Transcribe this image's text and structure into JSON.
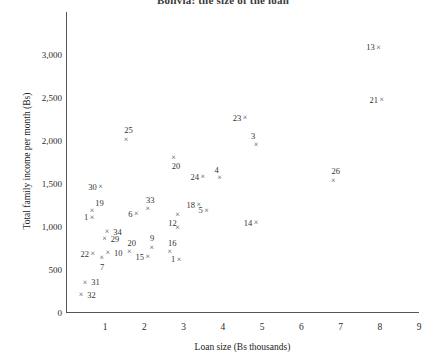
{
  "chart_data": {
    "type": "scatter",
    "title": "Bolivia: the size of the loan",
    "xlabel": "Loan size (Bs thousands)",
    "ylabel": "Total family income per month (Bs)",
    "xlim": [
      0.35,
      9.3
    ],
    "ylim": [
      0,
      3250
    ],
    "xticks": [
      "1",
      "2",
      "3",
      "4",
      "5",
      "6",
      "7",
      "8",
      "9"
    ],
    "yticks": [
      "0",
      "500",
      "1,000",
      "1,500",
      "2,000",
      "2,500",
      "3,000"
    ],
    "grid": false,
    "legend": null,
    "marker": "x",
    "marker_color": "#3f3f3f",
    "points": [
      {
        "label": "13",
        "x": 8.0,
        "y": 3080,
        "label_pos": "left"
      },
      {
        "label": "21",
        "x": 8.08,
        "y": 2470,
        "label_pos": "left"
      },
      {
        "label": "23",
        "x": 4.6,
        "y": 2260,
        "label_pos": "left"
      },
      {
        "label": "3",
        "x": 4.88,
        "y": 1950,
        "label_pos": "aboveleft"
      },
      {
        "label": "25",
        "x": 1.57,
        "y": 2010,
        "label_pos": "above"
      },
      {
        "label": "20",
        "x": 2.78,
        "y": 1800,
        "label_pos": "below"
      },
      {
        "label": "26",
        "x": 6.85,
        "y": 1530,
        "label_pos": "above"
      },
      {
        "label": "24",
        "x": 3.52,
        "y": 1575,
        "label_pos": "left"
      },
      {
        "label": "4",
        "x": 3.95,
        "y": 1560,
        "label_pos": "aboveleft"
      },
      {
        "label": "30",
        "x": 0.92,
        "y": 1455,
        "label_pos": "left"
      },
      {
        "label": "18",
        "x": 3.42,
        "y": 1250,
        "label_pos": "left"
      },
      {
        "label": "5",
        "x": 3.62,
        "y": 1185,
        "label_pos": "left"
      },
      {
        "label": "33",
        "x": 2.12,
        "y": 1200,
        "label_pos": "above"
      },
      {
        "label": "6",
        "x": 1.83,
        "y": 1140,
        "label_pos": "left"
      },
      {
        "label": "19",
        "x": 0.7,
        "y": 1175,
        "label_pos": "aboveright"
      },
      {
        "label": "1",
        "x": 0.7,
        "y": 1100,
        "label_pos": "left"
      },
      {
        "label": "12",
        "x": 2.88,
        "y": 1130,
        "label_pos": "belowleft"
      },
      {
        "label": "",
        "x": 2.88,
        "y": 980,
        "label_pos": "none"
      },
      {
        "label": "34",
        "x": 1.08,
        "y": 935,
        "label_pos": "right"
      },
      {
        "label": "29",
        "x": 1.02,
        "y": 850,
        "label_pos": "right"
      },
      {
        "label": "9",
        "x": 2.22,
        "y": 755,
        "label_pos": "above"
      },
      {
        "label": "16",
        "x": 2.68,
        "y": 700,
        "label_pos": "above"
      },
      {
        "label": "22",
        "x": 0.72,
        "y": 680,
        "label_pos": "left"
      },
      {
        "label": "10",
        "x": 1.1,
        "y": 690,
        "label_pos": "right"
      },
      {
        "label": "20",
        "x": 1.65,
        "y": 700,
        "label_pos": "above"
      },
      {
        "label": "7",
        "x": 0.95,
        "y": 630,
        "label_pos": "below"
      },
      {
        "label": "15",
        "x": 2.12,
        "y": 640,
        "label_pos": "left"
      },
      {
        "label": "1",
        "x": 2.92,
        "y": 615,
        "label_pos": "left"
      },
      {
        "label": "14",
        "x": 4.88,
        "y": 1040,
        "label_pos": "left"
      },
      {
        "label": "31",
        "x": 0.52,
        "y": 345,
        "label_pos": "right"
      },
      {
        "label": "32",
        "x": 0.42,
        "y": 200,
        "label_pos": "right"
      }
    ]
  }
}
